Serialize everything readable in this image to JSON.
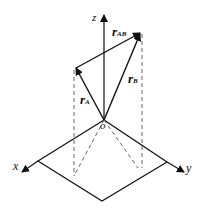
{
  "diagram": {
    "type": "3d-vector-diagram",
    "axes": {
      "x": "x",
      "y": "y",
      "z": "z"
    },
    "origin": "o",
    "vectors": [
      {
        "name": "r_A",
        "base": "r",
        "sub": "A"
      },
      {
        "name": "r_B",
        "base": "r",
        "sub": "B"
      },
      {
        "name": "r_AB",
        "base": "r",
        "sub": "AB"
      }
    ],
    "colors": {
      "line": "#111111",
      "dashed": "#555555",
      "background": "#ffffff"
    }
  }
}
